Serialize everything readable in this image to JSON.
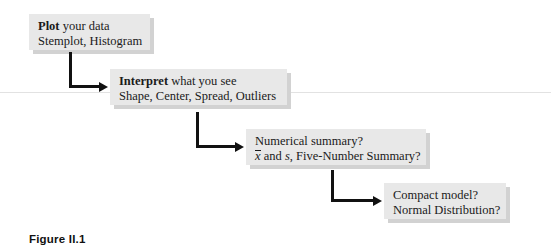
{
  "figure": {
    "caption": "Figure II.1",
    "rule_color": "#e2e2e2",
    "box_fill": "#e8e8e8",
    "box_shadow": "#d2d2d2",
    "arrow_color": "#111111"
  },
  "diagram": {
    "type": "flowchart",
    "direction": "cascading-down-right",
    "steps": [
      {
        "id": "plot",
        "heading": "Plot",
        "heading_rest": " your data",
        "detail": "Stemplot, Histogram"
      },
      {
        "id": "interpret",
        "heading": "Interpret",
        "heading_rest": " what you see",
        "detail": "Shape, Center, Spread, Outliers"
      },
      {
        "id": "numerical-summary",
        "heading": "",
        "heading_rest": "Numerical summary?",
        "detail_prefix": "x",
        "detail_mid": " and ",
        "detail_var": "s",
        "detail_suffix": ", Five-Number Summary?"
      },
      {
        "id": "compact-model",
        "heading": "",
        "heading_rest": "Compact model?",
        "detail": "Normal Distribution?"
      }
    ],
    "connectors": [
      {
        "id": "plot-to-interpret",
        "from": "plot",
        "to": "interpret"
      },
      {
        "id": "interpret-to-numerical-summary",
        "from": "interpret",
        "to": "numerical-summary"
      },
      {
        "id": "numerical-summary-to-compact-model",
        "from": "numerical-summary",
        "to": "compact-model"
      }
    ]
  }
}
